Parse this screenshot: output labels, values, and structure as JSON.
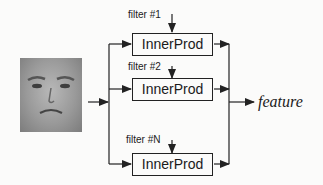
{
  "diagram": {
    "input": {
      "name": "face-image",
      "description": "grayscale face photo"
    },
    "filters": [
      {
        "label": "filter #1",
        "box_label": "InnerProd"
      },
      {
        "label": "filter #2",
        "box_label": "InnerProd"
      },
      {
        "label": "filter #N",
        "box_label": "InnerProd"
      }
    ],
    "output": {
      "label": "feature"
    },
    "colors": {
      "line": "#222222",
      "background": "#fbfbfa"
    }
  }
}
